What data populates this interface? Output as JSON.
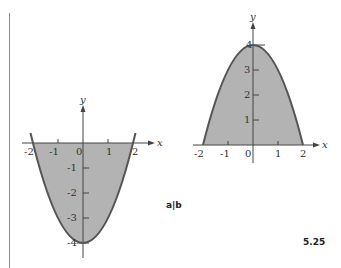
{
  "figure": {
    "number": "5.25",
    "panel_label": "a|b"
  },
  "colors": {
    "fill": "#b3b3b3",
    "curve": "#555555",
    "axis": "#444444",
    "text": "#333333",
    "frame_line": "#888888"
  },
  "plots": [
    {
      "id": "left",
      "function": "y = x^2 - 4",
      "x_axis_label": "x",
      "y_axis_label": "y",
      "x_ticks": [
        "-2",
        "-1",
        "0",
        "1",
        "2"
      ],
      "y_ticks": [
        "-1",
        "-2",
        "-3",
        "-4"
      ]
    },
    {
      "id": "right",
      "function": "y = 4 - x^2",
      "x_axis_label": "x",
      "y_axis_label": "y",
      "x_ticks": [
        "-2",
        "-1",
        "0",
        "1",
        "2"
      ],
      "y_ticks": [
        "1",
        "2",
        "3",
        "4"
      ]
    }
  ]
}
